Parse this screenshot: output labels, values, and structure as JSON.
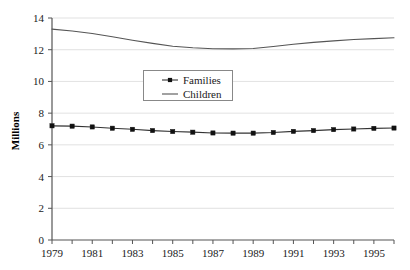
{
  "chart_data": {
    "type": "line",
    "title": "",
    "subtitle": "",
    "xlabel": "",
    "ylabel": "Millions",
    "xlim": [
      1979,
      1996
    ],
    "ylim": [
      0,
      14
    ],
    "y_ticks": [
      0,
      2,
      4,
      6,
      8,
      10,
      12,
      14
    ],
    "y_tick_labels": [
      "0",
      "2",
      "4",
      "6",
      "8",
      "10",
      "12",
      "14"
    ],
    "x_ticks": [
      1979,
      1980,
      1981,
      1982,
      1983,
      1984,
      1985,
      1986,
      1987,
      1988,
      1989,
      1990,
      1991,
      1992,
      1993,
      1994,
      1995,
      1996
    ],
    "x_tick_labels": [
      "1979",
      "",
      "1981",
      "",
      "1983",
      "",
      "1985",
      "",
      "1987",
      "",
      "1989",
      "",
      "1991",
      "",
      "1993",
      "",
      "1995",
      ""
    ],
    "x": [
      1979,
      1980,
      1981,
      1982,
      1983,
      1984,
      1985,
      1986,
      1987,
      1988,
      1989,
      1990,
      1991,
      1992,
      1993,
      1994,
      1995,
      1996
    ],
    "grid": "horizontal",
    "legend_position": "upper-center",
    "series": [
      {
        "name": "Families",
        "marker": "square",
        "color": "#333333",
        "values": [
          7.2,
          7.18,
          7.13,
          7.05,
          6.98,
          6.9,
          6.84,
          6.8,
          6.75,
          6.74,
          6.74,
          6.78,
          6.85,
          6.9,
          6.96,
          7.0,
          7.04,
          7.06
        ]
      },
      {
        "name": "Children",
        "marker": "none",
        "color": "#555555",
        "values": [
          13.3,
          13.18,
          13.02,
          12.82,
          12.6,
          12.4,
          12.22,
          12.12,
          12.06,
          12.05,
          12.08,
          12.2,
          12.34,
          12.46,
          12.56,
          12.64,
          12.7,
          12.75
        ]
      }
    ]
  },
  "legend": {
    "entries": [
      {
        "label": "Families",
        "marker": "square-line"
      },
      {
        "label": "Children",
        "marker": "line"
      }
    ]
  },
  "axes": {
    "y_title": "Millions"
  }
}
